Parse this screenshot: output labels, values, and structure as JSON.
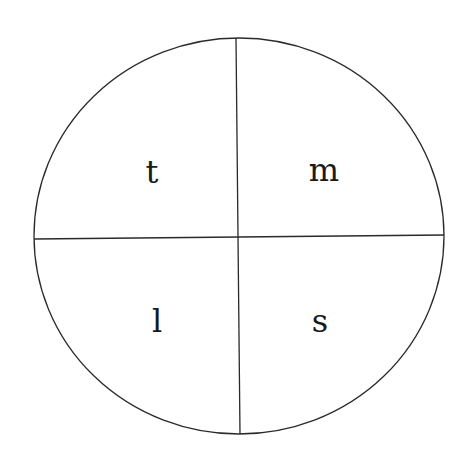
{
  "diagram": {
    "shape": "circle divided into four quadrants",
    "quadrants": [
      {
        "position": "top-left",
        "label": "t"
      },
      {
        "position": "top-right",
        "label": "m"
      },
      {
        "position": "bottom-left",
        "label": "l"
      },
      {
        "position": "bottom-right",
        "label": "s"
      }
    ],
    "stroke_color": "#2a2a2a",
    "background_color": "#ffffff"
  }
}
